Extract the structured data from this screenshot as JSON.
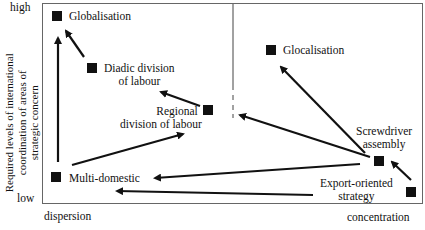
{
  "diagram": {
    "y_axis": {
      "label_lines": [
        "Required levels of international",
        "coordination of areas of",
        "strategic concern"
      ],
      "high": "high",
      "low": "low"
    },
    "x_axis": {
      "left": "dispersion",
      "right": "concentration"
    },
    "nodes": {
      "globalisation": "Globalisation",
      "diadic_1": "Diadic division",
      "diadic_2": "of labour",
      "regional_1": "Regional",
      "regional_2": "division of labour",
      "multidomestic": "Multi-domestic",
      "glocalisation": "Glocalisation",
      "screwdriver_1": "Screwdriver",
      "screwdriver_2": "assembly",
      "export_1": "Export-oriented",
      "export_2": "strategy"
    },
    "edges": [
      [
        "Multi-domestic",
        "Globalisation"
      ],
      [
        "Diadic division of labour",
        "Globalisation"
      ],
      [
        "Regional division of labour",
        "Diadic division of labour"
      ],
      [
        "Multi-domestic",
        "Regional division of labour"
      ],
      [
        "Screwdriver assembly",
        "Regional division of labour"
      ],
      [
        "Screwdriver assembly",
        "Glocalisation"
      ],
      [
        "Screwdriver assembly",
        "Multi-domestic"
      ],
      [
        "Export-oriented strategy",
        "Multi-domestic"
      ],
      [
        "Export-oriented strategy",
        "Screwdriver assembly"
      ]
    ]
  }
}
